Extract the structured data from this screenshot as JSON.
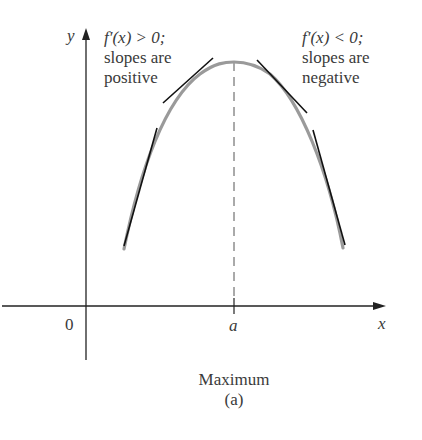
{
  "figure": {
    "axis_labels": {
      "y": "y",
      "x": "x",
      "origin": "0",
      "a_tick": "a"
    },
    "left_annotation": {
      "line1": "f′(x) > 0;",
      "line2": "slopes are",
      "line3": "positive"
    },
    "right_annotation": {
      "line1": "f′(x) < 0;",
      "line2": "slopes are",
      "line3": "negative"
    },
    "caption": {
      "title": "Maximum",
      "sub": "(a)"
    },
    "colors": {
      "curve": "#9a9a9a",
      "tangent": "#111111",
      "axis": "#222222",
      "dash": "#555555"
    }
  }
}
